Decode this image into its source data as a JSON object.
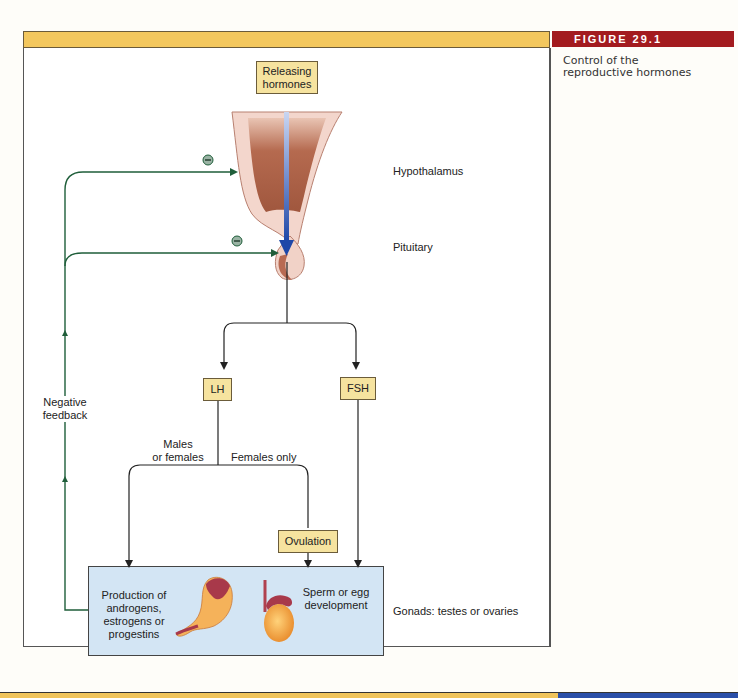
{
  "figure": {
    "number_label": "FIGURE 29.1",
    "caption_line1": "Control of the",
    "caption_line2": "reproductive hormones"
  },
  "nodes": {
    "releasing_hormones_line1": "Releasing",
    "releasing_hormones_line2": "hormones",
    "lh": "LH",
    "fsh": "FSH",
    "ovulation": "Ovulation"
  },
  "labels": {
    "hypothalamus": "Hypothalamus",
    "pituitary": "Pituitary",
    "negative_feedback_line1": "Negative",
    "negative_feedback_line2": "feedback",
    "males_or_females_line1": "Males",
    "males_or_females_line2": "or females",
    "females_only": "Females only",
    "gonads": "Gonads: testes or ovaries",
    "inhibit_symbol": "−"
  },
  "gonad_box": {
    "production_lines": [
      "Production of",
      "androgens,",
      "estrogens or",
      "progestins"
    ],
    "sperm_egg_lines": [
      "Sperm or egg",
      "development"
    ]
  },
  "colors": {
    "header_bar": "#f3c75e",
    "figure_badge": "#a31b1f",
    "node_fill": "#f6e39f",
    "gonad_fill": "#d3e5f4",
    "feedback_line": "#1f5e3a",
    "releasing_arrow": "#2a55b5",
    "bottom_blue": "#2a4fa8"
  }
}
